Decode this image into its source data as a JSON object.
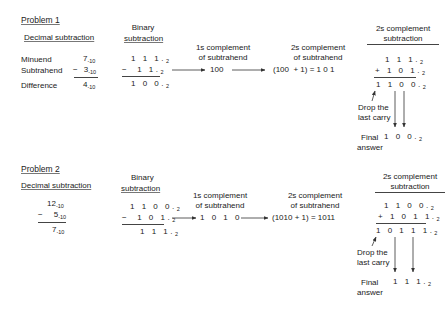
{
  "problem1": {
    "title": "Problem 1",
    "decimal": {
      "header": "Decimal subtraction",
      "labels": [
        "Minuend",
        "Subtrahend",
        "Difference"
      ],
      "minuend": "7",
      "subtrahend": "3",
      "difference": "4",
      "base": "10",
      "minus": "−"
    },
    "binary": {
      "header1": "Binary",
      "header2": "subtraction",
      "minuend": "1 1 1.",
      "subtrahend": "1 1.",
      "difference": "1 0 0.",
      "base": "2",
      "minus": "−"
    },
    "ones_complement": {
      "line1": "1s complement",
      "line2": "of subtrahend",
      "value": "100"
    },
    "twos_complement": {
      "line1": "2s complement",
      "line2": "of subtrahend",
      "value": "(100  + 1) = 1 0 1"
    },
    "twos_subtraction": {
      "header1": "2s complement",
      "header2": "subtraction",
      "row1": "1 1 1.",
      "row2": "+ 1 0 1.",
      "result": "1 1 0 0.",
      "base": "2",
      "drop1": "Drop the",
      "drop2": "last carry",
      "final1": "Final",
      "final2": "answer",
      "final_value": "1 0 0."
    }
  },
  "problem2": {
    "title": "Problem 2",
    "decimal": {
      "header": "Decimal subtraction",
      "minuend": "12",
      "subtrahend": "5",
      "difference": "7",
      "base": "10",
      "minus": "−"
    },
    "binary": {
      "header1": "Binary",
      "header2": "subtraction",
      "minuend": "1 1 0 0.",
      "subtrahend": "1 0 1.",
      "difference": "1 1 1.",
      "base": "2",
      "minus": "−"
    },
    "ones_complement": {
      "line1": "1s complement",
      "line2": "of subtrahend",
      "value": "1 0 1 0"
    },
    "twos_complement": {
      "line1": "2s complement",
      "line2": "of subtrahend",
      "value": "(1010 + 1) = 1011"
    },
    "twos_subtraction": {
      "header1": "2s complement",
      "header2": "subtraction",
      "row1": "1 1 0 0.",
      "row2": "+ 1 0 1 1.",
      "result": "1 0 1 1 1.",
      "base": "2",
      "drop1": "Drop the",
      "drop2": "last carry",
      "final1": "Final",
      "final2": "answer",
      "final_value": "1 1 1."
    }
  }
}
